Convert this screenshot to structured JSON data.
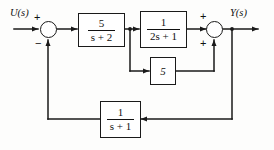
{
  "diagram": {
    "stroke_color": "#1a1a1a",
    "background_color": "#fdfdfc",
    "input_label": "U(s)",
    "output_label": "Y(s)",
    "summing_junctions": [
      {
        "id": "sum-1",
        "signs": {
          "top_left": "+",
          "bottom": "−"
        },
        "inputs": [
          "input",
          "outer-feedback"
        ],
        "output": "forward-block-1"
      },
      {
        "id": "sum-2",
        "signs": {
          "top_left": "+",
          "bottom_left": "+"
        },
        "inputs": [
          "forward-block-2",
          "inner-gain"
        ],
        "output": "output"
      }
    ],
    "blocks": [
      {
        "id": "forward-block-1",
        "name": "transfer-function-5-over-s-plus-2",
        "type": "fraction",
        "numerator": "5",
        "denominator": "s + 2",
        "expression": "5/(s+2)"
      },
      {
        "id": "forward-block-2",
        "name": "transfer-function-1-over-2s-plus-1",
        "type": "fraction",
        "numerator": "1",
        "denominator": "2s + 1",
        "expression": "1/(2s+1)"
      },
      {
        "id": "inner-gain",
        "name": "gain-block-5",
        "type": "gain",
        "value": "5",
        "expression": "5"
      },
      {
        "id": "outer-feedback",
        "name": "transfer-function-1-over-s-plus-1",
        "type": "fraction",
        "numerator": "1",
        "denominator": "s + 1",
        "expression": "1/(s+1)"
      }
    ],
    "signs": {
      "plus": "+",
      "minus": "−"
    }
  }
}
